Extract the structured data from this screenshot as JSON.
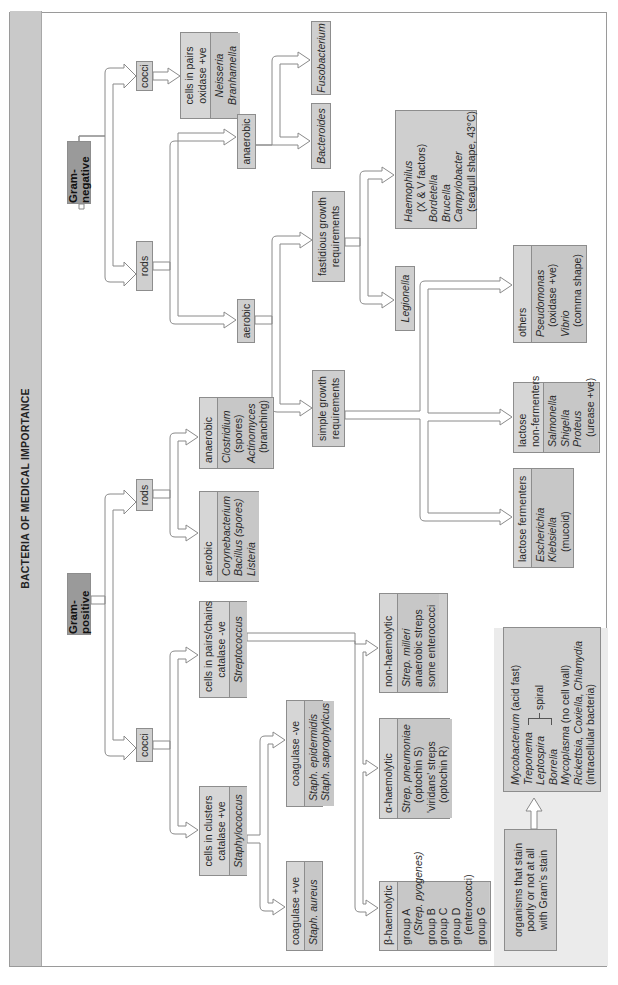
{
  "title": "BACTERIA OF MEDICAL IMPORTANCE",
  "gram_negative": {
    "label": "Gram-negative",
    "cocci": {
      "label": "cocci",
      "result": {
        "header": [
          "cells in pairs",
          "oxidase +ve"
        ],
        "organisms": [
          "Neisseria",
          "Branhamella"
        ]
      }
    },
    "rods": {
      "label": "rods",
      "anaerobic": {
        "label": "anaerobic",
        "organisms": [
          "Bacteroides",
          "Fusobacterium"
        ]
      },
      "aerobic": {
        "label": "aerobic",
        "fastidious": {
          "label": [
            "fastidious growth",
            "requirements"
          ],
          "organisms_box": [
            "Haemophilus",
            "(X & V factors)",
            "Bordetella",
            "Brucella",
            "Campylobacter",
            "(seagull shape, 43°C)"
          ],
          "legionella": "Legionella"
        },
        "simple": {
          "label": [
            "simple growth",
            "requirements"
          ],
          "lactose_fermenters": {
            "header": "lactose fermenters",
            "organisms": [
              "Escherichia",
              "Klebsiella",
              "(mucoid)"
            ]
          },
          "lactose_non_fermenters": {
            "header": [
              "lactose",
              "non-fermenters"
            ],
            "organisms": [
              "Salmonella",
              "Shigella",
              "Proteus",
              "(urease +ve)"
            ]
          },
          "others": {
            "header": "others",
            "organisms": [
              "Pseudomonas",
              "(oxidase +ve)",
              "Vibrio",
              "(comma shape)"
            ]
          }
        }
      }
    }
  },
  "gram_positive": {
    "label": "Gram-positive",
    "rods": {
      "label": "rods",
      "aerobic": {
        "header": "aerobic",
        "organisms": [
          "Corynebacterium",
          "Bacillus (spores)",
          "Listeria"
        ]
      },
      "anaerobic": {
        "header": "anaerobic",
        "organisms": [
          "Clostridium",
          "(spores)",
          "Actinomyces",
          "(branching)"
        ]
      }
    },
    "cocci": {
      "label": "cocci",
      "clusters": {
        "header": [
          "cells in clusters",
          "catalase +ve"
        ],
        "organism": "Staphylococcus",
        "coag_pos": {
          "header": "coagulase +ve",
          "organisms": [
            "Staph. aureus"
          ]
        },
        "coag_neg": {
          "header": "coagulase -ve",
          "organisms": [
            "Staph. epidermidis",
            "Staph. saprophyticus"
          ]
        }
      },
      "chains": {
        "header": [
          "cells in pairs/chains",
          "catalase -ve"
        ],
        "organism": "Streptococcus",
        "beta": {
          "header": "β-haemolytic",
          "items": [
            "group A",
            "(Strep. pyogenes)",
            "group B",
            "group C",
            "group D",
            "(enterococci)",
            "group G"
          ]
        },
        "alpha": {
          "header": "α-haemolytic",
          "items": [
            "Strep. pneumoniae",
            "(optochin S)",
            "'viridans' streps",
            "(optochin R)"
          ]
        },
        "non": {
          "header": "non-haemolytic",
          "items": [
            "Strep. milleri",
            "anaerobic streps",
            "some enterococci"
          ]
        }
      }
    }
  },
  "poor_stain": {
    "label": [
      "organisms that stain",
      "poorly or not at all",
      "with Gram's stain"
    ],
    "organisms": {
      "mycobacterium": "Mycobacterium",
      "mycobacterium_note": "(acid fast)",
      "treponema": "Treponema",
      "leptospira": "Leptospira",
      "borrelia": "Borrelia",
      "spiral": "spiral",
      "mycoplasma": "Mycoplasma",
      "mycoplasma_note": "(no cell wall)",
      "rickettsia_line": "Rickettsia, Coxiella, Chlamydia",
      "intracellular": "(intracellular bacteria)"
    }
  }
}
